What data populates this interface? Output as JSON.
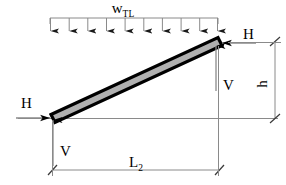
{
  "figure": {
    "type": "engineering-free-body-diagram",
    "background_color": "#ffffff",
    "beam_fill_color": "#b0b0b0",
    "beam_outline_color": "#000000",
    "line_color": "#808080",
    "arrow_color": "#000000"
  },
  "labels": {
    "distributed_load": {
      "base": "w",
      "subscript": "TL"
    },
    "horizontal_reaction_left": "H",
    "horizontal_reaction_right": "H",
    "vertical_reaction_left": "V",
    "vertical_reaction_right": "V",
    "span_dimension": {
      "base": "L",
      "subscript": "2"
    },
    "height_dimension": "h"
  },
  "geometry": {
    "beam": {
      "left_end": {
        "x": 52,
        "y": 119
      },
      "right_end": {
        "x": 219,
        "y": 42
      },
      "thickness": 9
    },
    "load_line": {
      "x_start": 50,
      "x_end": 218,
      "y": 18
    },
    "load_arrow_count": 10,
    "span_dimension_line": {
      "x_start": 52,
      "y": 170,
      "x_end": 219
    },
    "height_dimension_line": {
      "x": 275,
      "y_start": 42,
      "y_end": 119
    },
    "baseline": {
      "x_start": 18,
      "x_end": 278,
      "y": 119
    }
  }
}
